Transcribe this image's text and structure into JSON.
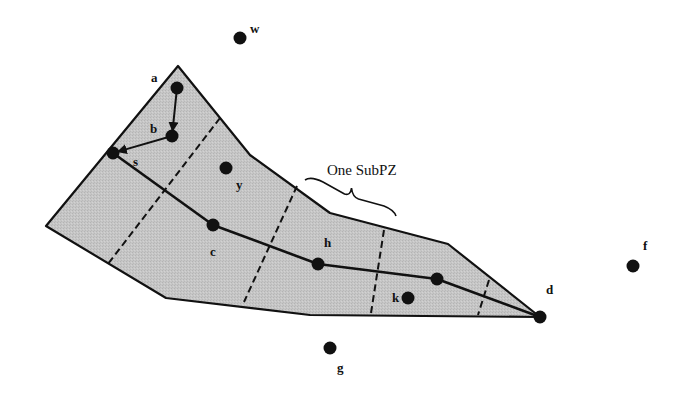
{
  "diagram": {
    "type": "planning-zone-path",
    "colors": {
      "region_fill": "#c4c4c4",
      "stroke": "#111111",
      "node": "#111111",
      "background": "#ffffff"
    },
    "annotation": {
      "label": "One SubPZ",
      "brace_from": [
        305,
        180
      ],
      "brace_to": [
        396,
        216
      ]
    },
    "region_polygon": [
      [
        178,
        66
      ],
      [
        250,
        155
      ],
      [
        330,
        213
      ],
      [
        448,
        244
      ],
      [
        540,
        317
      ],
      [
        310,
        315
      ],
      [
        166,
        298
      ],
      [
        46,
        226
      ]
    ],
    "subzone_dividers": [
      [
        [
          220,
          118
        ],
        [
          108,
          264
        ]
      ],
      [
        [
          297,
          186
        ],
        [
          244,
          302
        ]
      ],
      [
        [
          384,
          230
        ],
        [
          371,
          313
        ]
      ],
      [
        [
          489,
          280
        ],
        [
          478,
          315
        ]
      ]
    ],
    "nodes": [
      {
        "id": "a",
        "label": "a",
        "x": 177,
        "y": 88,
        "lx": 151,
        "ly": 82,
        "inside": true
      },
      {
        "id": "b",
        "label": "b",
        "x": 172,
        "y": 136,
        "lx": 150,
        "ly": 133,
        "inside": true
      },
      {
        "id": "s",
        "label": "s",
        "x": 113,
        "y": 153,
        "lx": 133,
        "ly": 166,
        "inside": true
      },
      {
        "id": "y",
        "label": "y",
        "x": 226,
        "y": 168,
        "lx": 236,
        "ly": 189,
        "inside": true
      },
      {
        "id": "c",
        "label": "c",
        "x": 213,
        "y": 225,
        "lx": 210,
        "ly": 256,
        "inside": true
      },
      {
        "id": "h",
        "label": "h",
        "x": 318,
        "y": 264,
        "lx": 324,
        "ly": 247,
        "inside": true
      },
      {
        "id": "p",
        "label": "",
        "x": 437,
        "y": 279,
        "lx": 0,
        "ly": 0,
        "inside": true
      },
      {
        "id": "k",
        "label": "k",
        "x": 408,
        "y": 298,
        "lx": 392,
        "ly": 302,
        "inside": true
      },
      {
        "id": "d",
        "label": "d",
        "x": 540,
        "y": 317,
        "lx": 546,
        "ly": 294,
        "inside": false
      },
      {
        "id": "w",
        "label": "w",
        "x": 240,
        "y": 38,
        "lx": 250,
        "ly": 33,
        "inside": false
      },
      {
        "id": "f",
        "label": "f",
        "x": 633,
        "y": 266,
        "lx": 643,
        "ly": 250,
        "inside": false
      },
      {
        "id": "g",
        "label": "g",
        "x": 330,
        "y": 348,
        "lx": 337,
        "ly": 372,
        "inside": false
      }
    ],
    "arrows": [
      {
        "from": "a",
        "to": "b"
      },
      {
        "from": "b",
        "to": "s"
      }
    ],
    "path": [
      "s",
      "c",
      "h",
      "p",
      "d"
    ]
  }
}
